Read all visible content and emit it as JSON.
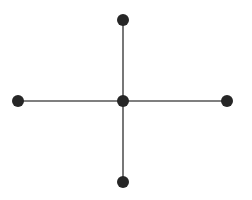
{
  "diagram": {
    "type": "star-graph",
    "background": "#ffffff",
    "edge_color": "#555555",
    "node_color": "#262626",
    "node_radius": 6,
    "nodes": [
      {
        "id": "center",
        "x": 123,
        "y": 101
      },
      {
        "id": "top",
        "x": 123,
        "y": 20
      },
      {
        "id": "left",
        "x": 18,
        "y": 101
      },
      {
        "id": "right",
        "x": 227,
        "y": 101
      },
      {
        "id": "bottom",
        "x": 123,
        "y": 182
      }
    ],
    "edges": [
      {
        "from": "center",
        "to": "top"
      },
      {
        "from": "center",
        "to": "left"
      },
      {
        "from": "center",
        "to": "right"
      },
      {
        "from": "center",
        "to": "bottom"
      }
    ]
  }
}
